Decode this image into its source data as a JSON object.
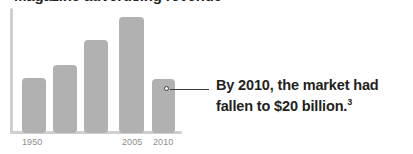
{
  "chart_data": {
    "type": "bar",
    "title": "",
    "xlabel": "",
    "ylabel": "",
    "categories": [
      "1950",
      "",
      "",
      "2005",
      "2010"
    ],
    "values": [
      55,
      68,
      93,
      116,
      54
    ],
    "tick_labels": [
      "1950",
      "2005",
      "2010"
    ],
    "grid": false,
    "legend": "none",
    "bar_color": "#b1b1b1",
    "axis_color": "#cfcfcf",
    "annotation": {
      "line1": "By 2010, the market had",
      "line2": "fallen to $20 billion.",
      "footnote": "3",
      "target_category": "2010",
      "target_value_text": "$20 billion"
    }
  },
  "figure": {
    "title_clipped": "Magazine advertising revenue",
    "ticks": [
      {
        "label": "1950",
        "left": 22
      },
      {
        "label": "2005",
        "left": 122
      },
      {
        "label": "2010",
        "left": 153
      }
    ],
    "bars": [
      {
        "name": "bar-1950",
        "left": 22,
        "top": 78,
        "width": 24,
        "height": 55
      },
      {
        "name": "bar-2",
        "left": 53,
        "top": 65,
        "width": 24,
        "height": 68
      },
      {
        "name": "bar-3",
        "left": 84,
        "top": 40,
        "width": 24,
        "height": 93
      },
      {
        "name": "bar-2005",
        "left": 119,
        "top": 17,
        "width": 25,
        "height": 116
      },
      {
        "name": "bar-2010",
        "left": 152,
        "top": 79,
        "width": 23,
        "height": 54
      }
    ]
  }
}
